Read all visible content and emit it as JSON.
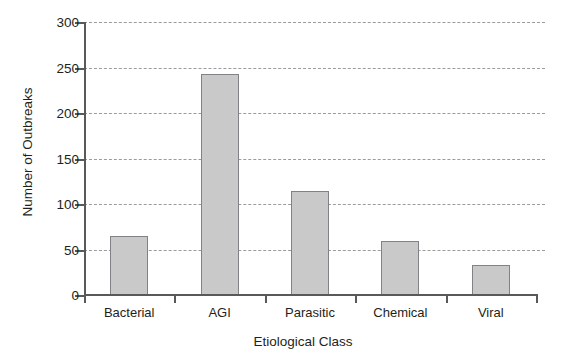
{
  "chart_data": {
    "type": "bar",
    "title": "",
    "xlabel": "Etiological Class",
    "ylabel": "Number of Outbreaks",
    "categories": [
      "Bacterial",
      "AGI",
      "Parasitic",
      "Chemical",
      "Viral"
    ],
    "values": [
      65,
      243,
      114,
      59,
      33
    ],
    "ylim": [
      0,
      300
    ],
    "yticks": [
      0,
      50,
      100,
      150,
      200,
      250,
      300
    ],
    "ytick_labels": [
      "0",
      "50",
      "100",
      "150",
      "200",
      "250",
      "300"
    ],
    "grid": "horizontal-dashed",
    "legend": "none",
    "bar_fill": "#c9c9c9",
    "bar_edge": "#818285",
    "grid_color": "#9b9b9b",
    "axis_color": "#58595b"
  },
  "axes": {
    "y_title": "Number of Outbreaks",
    "x_title": "Etiological Class",
    "ytick_0": "0",
    "ytick_1": "50",
    "ytick_2": "100",
    "ytick_3": "150",
    "ytick_4": "200",
    "ytick_5": "250",
    "ytick_6": "300"
  },
  "bars": [
    {
      "label": "Bacterial",
      "value": 65
    },
    {
      "label": "AGI",
      "value": 243
    },
    {
      "label": "Parasitic",
      "value": 114
    },
    {
      "label": "Chemical",
      "value": 59
    },
    {
      "label": "Viral",
      "value": 33
    }
  ]
}
